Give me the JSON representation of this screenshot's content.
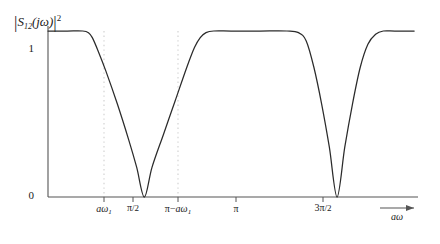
{
  "chart_data": {
    "type": "line",
    "title": "",
    "ylabel": "|S12(jω)|²",
    "ylabel_parts": {
      "symbol": "S",
      "subscript": "12",
      "argument": "(jω)",
      "exponent": "2"
    },
    "xlabel": "aω",
    "ylim": [
      0,
      1.08
    ],
    "xlim": [
      0,
      1.92
    ],
    "grid": false,
    "legend": null,
    "yticks": [
      {
        "value": 0,
        "label": "0"
      },
      {
        "value": 1,
        "label": "1"
      }
    ],
    "xticks": [
      {
        "value": 0.22,
        "label": "aω1",
        "base": "a",
        "sub": "ω1",
        "kind": "italic-omega"
      },
      {
        "value": 0.5,
        "label": "π/2",
        "num": "π",
        "den": "2",
        "kind": "fraction"
      },
      {
        "value": 0.78,
        "label": "π−aω1",
        "prefix": "π−",
        "base": "a",
        "sub": "ω1",
        "kind": "pi-minus"
      },
      {
        "value": 1.0,
        "label": "π",
        "kind": "plain"
      },
      {
        "value": 1.5,
        "label": "3π/2",
        "num": "3π",
        "den": "2",
        "kind": "fraction"
      }
    ],
    "guide_lines": [
      {
        "x": 0.22,
        "style": "dotted",
        "label": "aω1"
      },
      {
        "x": 0.78,
        "style": "dotted",
        "label": "π−aω1"
      }
    ],
    "notches": [
      {
        "center": 0.5,
        "zero_value": 0,
        "width": 0.56,
        "shape": "V",
        "note": "wide notch, flat-top shoulders at aω1 and π−aω1"
      },
      {
        "center": 1.5,
        "zero_value": 0,
        "width": 0.4,
        "shape": "V",
        "note": "narrower symmetric notch"
      }
    ],
    "passband_value": 1,
    "x": [
      0.0,
      0.1,
      0.18,
      0.21,
      0.23,
      0.26,
      0.3,
      0.36,
      0.42,
      0.46,
      0.5,
      0.54,
      0.6,
      0.66,
      0.72,
      0.76,
      0.79,
      0.82,
      0.86,
      0.95,
      1.1,
      1.24,
      1.3,
      1.34,
      1.38,
      1.42,
      1.46,
      1.5,
      1.54,
      1.58,
      1.62,
      1.66,
      1.7,
      1.74,
      1.8,
      1.9
    ],
    "y": [
      1.0,
      1.0,
      1.0,
      0.99,
      0.96,
      0.88,
      0.76,
      0.56,
      0.34,
      0.18,
      0.0,
      0.18,
      0.38,
      0.58,
      0.78,
      0.9,
      0.96,
      0.99,
      1.0,
      1.0,
      1.0,
      1.0,
      0.99,
      0.94,
      0.78,
      0.56,
      0.3,
      0.0,
      0.3,
      0.56,
      0.78,
      0.92,
      0.98,
      1.0,
      1.0,
      1.0
    ],
    "colors": {
      "curve": "#2b2b2b",
      "axis": "#3a3a3a",
      "guide": "#cfcfcf",
      "background": "#ffffff",
      "text": "#1a1a1a"
    }
  }
}
